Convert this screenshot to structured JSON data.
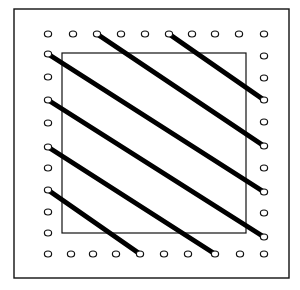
{
  "diagram": {
    "colors": {
      "background": "#ffffff",
      "line": "#111111",
      "string": "#000000",
      "hole_fill": "#ffffff"
    },
    "outer_frame": {
      "x1": 14,
      "y1": 9,
      "x2": 289,
      "y2": 278
    },
    "inner_square": {
      "x1": 62,
      "y1": 53,
      "x2": 246,
      "y2": 233
    },
    "holes": {
      "top": [
        [
          48,
          34
        ],
        [
          73,
          34
        ],
        [
          97,
          34
        ],
        [
          121,
          34
        ],
        [
          145,
          34
        ],
        [
          169,
          34
        ],
        [
          192,
          34
        ],
        [
          215,
          34
        ],
        [
          239,
          34
        ],
        [
          264,
          34
        ]
      ],
      "bottom": [
        [
          48,
          254
        ],
        [
          71,
          254
        ],
        [
          93,
          254
        ],
        [
          116,
          254
        ],
        [
          140,
          254
        ],
        [
          164,
          254
        ],
        [
          188,
          254
        ],
        [
          215,
          254
        ],
        [
          240,
          254
        ],
        [
          264,
          254
        ]
      ],
      "left": [
        [
          48,
          54
        ],
        [
          48,
          77
        ],
        [
          48,
          100
        ],
        [
          48,
          123
        ],
        [
          48,
          147
        ],
        [
          48,
          168
        ],
        [
          48,
          190
        ],
        [
          48,
          212
        ],
        [
          48,
          233
        ]
      ],
      "right": [
        [
          264,
          56
        ],
        [
          264,
          78
        ],
        [
          264,
          100
        ],
        [
          264,
          122
        ],
        [
          264,
          146
        ],
        [
          264,
          168
        ],
        [
          264,
          192
        ],
        [
          264,
          213
        ],
        [
          264,
          237
        ]
      ]
    },
    "strings": [
      {
        "from": [
          169,
          34
        ],
        "to": [
          264,
          100
        ]
      },
      {
        "from": [
          97,
          34
        ],
        "to": [
          264,
          146
        ]
      },
      {
        "from": [
          48,
          54
        ],
        "to": [
          264,
          192
        ]
      },
      {
        "from": [
          48,
          100
        ],
        "to": [
          264,
          237
        ]
      },
      {
        "from": [
          48,
          147
        ],
        "to": [
          215,
          254
        ]
      },
      {
        "from": [
          48,
          190
        ],
        "to": [
          140,
          254
        ]
      }
    ]
  }
}
